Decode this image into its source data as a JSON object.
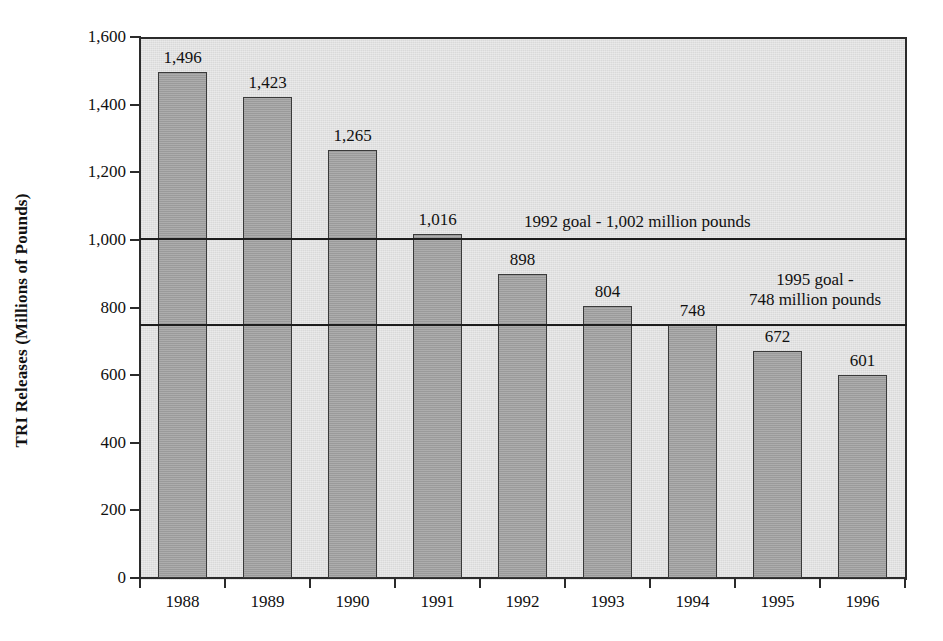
{
  "chart_data": {
    "type": "bar",
    "title": "",
    "xlabel": "",
    "ylabel": "TRI Releases (Millions of Pounds)",
    "categories": [
      "1988",
      "1989",
      "1990",
      "1991",
      "1992",
      "1993",
      "1994",
      "1995",
      "1996"
    ],
    "values": [
      1496,
      1423,
      1265,
      1016,
      898,
      804,
      748,
      672,
      601
    ],
    "value_labels": [
      "1,496",
      "1,423",
      "1,265",
      "1,016",
      "898",
      "804",
      "748",
      "672",
      "601"
    ],
    "ylim": [
      0,
      1600
    ],
    "ytick_values": [
      0,
      200,
      400,
      600,
      800,
      1000,
      1200,
      1400,
      1600
    ],
    "ytick_labels": [
      "0",
      "200",
      "400",
      "600",
      "800",
      "1,000",
      "1,200",
      "1,400",
      "1,600"
    ],
    "grid": false,
    "legend": "none",
    "reference_lines": [
      {
        "name": "1992-goal",
        "value": 1002,
        "label": "1992 goal - 1,002 million pounds",
        "label_lines": [
          "1992 goal - 1,002 million pounds"
        ]
      },
      {
        "name": "1995-goal",
        "value": 748,
        "label": "1995 goal - 748 million pounds",
        "label_lines": [
          "1995 goal -",
          "748 million pounds"
        ]
      }
    ],
    "colors": {
      "bar_fill": "#9d9d9d",
      "bar_edge": "#3a3a3a",
      "plot_background": "#d9d9d9",
      "axis": "#2b2b2b",
      "reference_line": "#1d1d1d",
      "text": "#111111",
      "figure_background": "#ffffff"
    }
  }
}
